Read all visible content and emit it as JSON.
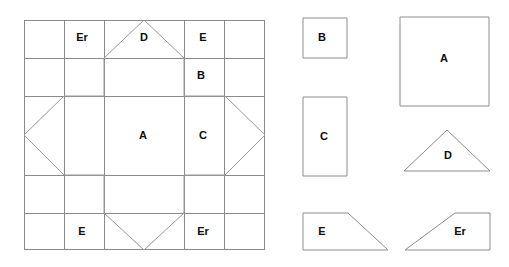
{
  "figure": {
    "title": "Cube net and component faces",
    "canvas": {
      "width": 509,
      "height": 267,
      "background": "#ffffff"
    },
    "colors": {
      "grid_line": "#8a8a8a",
      "outline": "#7d7d7d",
      "shape_stroke": "#8d8d8d",
      "fold_line": "#999999",
      "label_text": "#0d0d0d",
      "shape_fill": "#ffffff"
    },
    "net_panel": {
      "name": "net-grid",
      "bounds": {
        "x": 24,
        "y": 20,
        "width": 241,
        "height": 230
      },
      "vertical_grid_x": [
        64,
        104,
        184,
        225
      ],
      "horizontal_grid_y": [
        58,
        96,
        175,
        213
      ],
      "labels": [
        {
          "text": "Er",
          "x": 82,
          "y": 38
        },
        {
          "text": "D",
          "x": 144,
          "y": 38
        },
        {
          "text": "E",
          "x": 203,
          "y": 38
        },
        {
          "text": "B",
          "x": 201,
          "y": 76
        },
        {
          "text": "A",
          "x": 143,
          "y": 135
        },
        {
          "text": "C",
          "x": 203,
          "y": 135
        },
        {
          "text": "E",
          "x": 82,
          "y": 231
        },
        {
          "text": "Er",
          "x": 203,
          "y": 231
        }
      ],
      "fold_outline": "M 104 58 L 144 20 L 184 58 L 184 96 L 225 96 L 265 135 L 225 175 L 184 175 L 184 213 L 144 250 L 104 213 L 104 175 L 64 175 L 24 135 L 64 96 L 104 96 Z"
    },
    "shapes_panel": {
      "name": "component-shapes",
      "items": [
        {
          "id": "shape-b",
          "label": "B",
          "type": "square",
          "points": "303,18 347,18 347,58 303,58",
          "label_x": 322,
          "label_y": 38
        },
        {
          "id": "shape-c",
          "label": "C",
          "type": "rectangle",
          "points": "303,97 347,97 347,176 303,176",
          "label_x": 324,
          "label_y": 136
        },
        {
          "id": "shape-e",
          "label": "E",
          "type": "right-trapezoid",
          "points": "303,213 348,213 388,250 303,250",
          "label_x": 322,
          "label_y": 231
        },
        {
          "id": "shape-a",
          "label": "A",
          "type": "square",
          "points": "400,17 489,17 489,106 400,106",
          "label_x": 444,
          "label_y": 58
        },
        {
          "id": "shape-d",
          "label": "D",
          "type": "triangle",
          "points": "447,130 490,171 404,171",
          "label_x": 448,
          "label_y": 155
        },
        {
          "id": "shape-er",
          "label": "Er",
          "type": "right-trapezoid",
          "points": "455,213 490,213 490,250 405,250",
          "label_x": 460,
          "label_y": 231
        }
      ]
    }
  }
}
